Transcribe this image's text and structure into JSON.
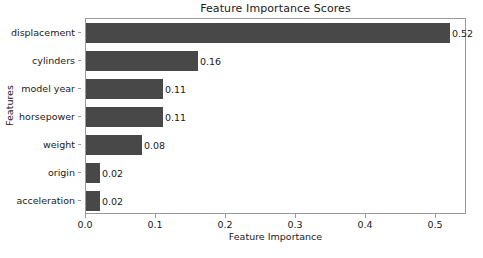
{
  "chart_data": {
    "type": "bar",
    "orientation": "horizontal",
    "title": "Feature Importance Scores",
    "xlabel": "Feature Importance",
    "ylabel": "Features",
    "categories": [
      "displacement",
      "cylinders",
      "model year",
      "horsepower",
      "weight",
      "origin",
      "acceleration"
    ],
    "values": [
      0.52,
      0.16,
      0.11,
      0.11,
      0.08,
      0.02,
      0.02
    ],
    "value_labels": [
      "0.52",
      "0.16",
      "0.11",
      "0.11",
      "0.08",
      "0.02",
      "0.02"
    ],
    "xticks": [
      0.0,
      0.1,
      0.2,
      0.3,
      0.4,
      0.5
    ],
    "xtick_labels": [
      "0.0",
      "0.1",
      "0.2",
      "0.3",
      "0.4",
      "0.5"
    ],
    "xlim": [
      0.0,
      0.5443
    ],
    "grid": false,
    "legend": null,
    "bar_color": "#484848",
    "axes_color": "#9a9a9a",
    "text_color": "#1a1a1a",
    "background": "#ffffff"
  }
}
